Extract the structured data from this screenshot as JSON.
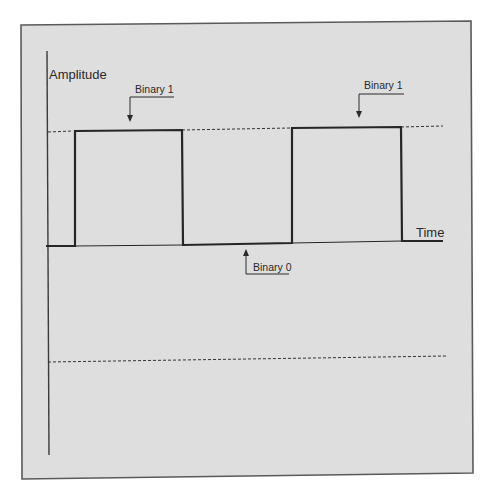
{
  "diagram": {
    "axes": {
      "y_label": "Amplitude",
      "x_label": "Time"
    },
    "annotations": [
      {
        "label": "Binary 1",
        "points_to": "first high pulse"
      },
      {
        "label": "Binary 0",
        "points_to": "low level between pulses"
      },
      {
        "label": "Binary 1",
        "points_to": "second high pulse"
      }
    ],
    "signal_sequence": [
      "0",
      "1",
      "0",
      "1",
      "0"
    ],
    "reference_lines": [
      "high level (dashed)",
      "low reference (dashed)"
    ],
    "colors": {
      "panel_fill": "#dedede",
      "panel_border": "#5a5a5a",
      "line": "#262626",
      "background": "#ffffff"
    }
  }
}
